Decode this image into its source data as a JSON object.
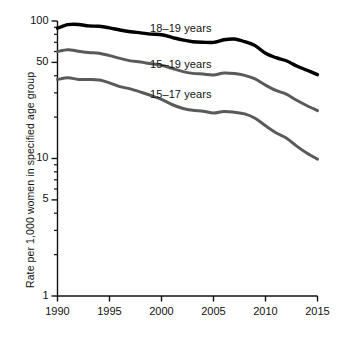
{
  "chart_data": {
    "type": "line",
    "title": "",
    "subtitle": "",
    "xlabel": "",
    "ylabel": "Rate per 1,000 women in specified age group",
    "yscale": "log",
    "ylim": [
      1,
      100
    ],
    "xlim": [
      1990,
      2015
    ],
    "grid": false,
    "legend_position": "inline-labels",
    "y_major_ticks": [
      1,
      5,
      10,
      50,
      100
    ],
    "y_major_tick_labels": [
      "1",
      "5",
      "10",
      "50",
      "100"
    ],
    "y_minor_ticks": [
      2,
      3,
      4,
      6,
      7,
      8,
      9,
      20,
      30,
      40,
      60,
      70,
      80,
      90
    ],
    "x_ticks": [
      1990,
      1995,
      2000,
      2005,
      2010,
      2015
    ],
    "x_tick_labels": [
      "1990",
      "1995",
      "2000",
      "2005",
      "2010",
      "2015"
    ],
    "x": [
      1990,
      1991,
      1992,
      1993,
      1994,
      1995,
      1996,
      1997,
      1998,
      1999,
      2000,
      2001,
      2002,
      2003,
      2004,
      2005,
      2006,
      2007,
      2008,
      2009,
      2010,
      2011,
      2012,
      2013,
      2014,
      2015
    ],
    "series": [
      {
        "name": "18–19 years",
        "color": "#000000",
        "label_text": "18–19 years",
        "values": [
          88.6,
          94.0,
          94.4,
          92.1,
          91.5,
          89.1,
          86.0,
          83.6,
          82.0,
          80.3,
          79.5,
          76.1,
          72.8,
          70.7,
          70.0,
          69.9,
          73.0,
          73.9,
          70.7,
          66.2,
          58.2,
          54.1,
          51.4,
          47.1,
          43.8,
          40.7
        ]
      },
      {
        "name": "15–19 years",
        "color": "#5a5a5a",
        "label_text": "15–19 years",
        "values": [
          59.9,
          61.8,
          60.3,
          59.0,
          58.2,
          56.0,
          53.5,
          51.3,
          50.3,
          48.8,
          47.7,
          45.3,
          43.0,
          41.6,
          41.1,
          40.5,
          41.9,
          41.5,
          40.2,
          37.9,
          34.2,
          31.3,
          29.4,
          26.5,
          24.2,
          22.3
        ]
      },
      {
        "name": "15–17 years",
        "color": "#5a5a5a",
        "label_text": "15–17 years",
        "values": [
          37.5,
          38.6,
          37.6,
          37.5,
          37.2,
          35.5,
          33.3,
          32.1,
          30.4,
          28.7,
          26.9,
          24.7,
          23.2,
          22.4,
          22.1,
          21.4,
          22.0,
          21.7,
          21.1,
          19.6,
          17.3,
          15.4,
          14.1,
          12.3,
          10.9,
          9.9
        ]
      }
    ]
  },
  "axes": {
    "y_title": "Rate per 1,000 women in specified age group"
  },
  "colors": {
    "axis": "#111111",
    "series_primary": "#000000",
    "series_secondary": "#5a5a5a",
    "background": "#ffffff"
  }
}
